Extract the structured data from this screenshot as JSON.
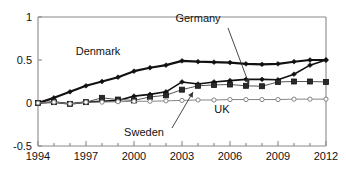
{
  "chart_data": {
    "type": "line",
    "title": "",
    "xlabel": "",
    "ylabel": "",
    "xlim": [
      1994,
      2012
    ],
    "ylim": [
      -0.5,
      1
    ],
    "yticks": [
      "1",
      "0.5",
      "0",
      "-0.5"
    ],
    "ytick_values": [
      1,
      0.5,
      0,
      -0.5
    ],
    "xticks": [
      "1994",
      "1997",
      "2000",
      "2003",
      "2006",
      "2009",
      "2012"
    ],
    "xtick_values": [
      1994,
      1997,
      2000,
      2003,
      2006,
      2009,
      2012
    ],
    "x": [
      1994,
      1995,
      1996,
      1997,
      1998,
      1999,
      2000,
      2001,
      2002,
      2003,
      2004,
      2005,
      2006,
      2007,
      2008,
      2009,
      2010,
      2011,
      2012
    ],
    "grid": false,
    "legend": "inline-annotations",
    "series": [
      {
        "name": "Denmark",
        "marker": "diamond-filled",
        "color": "#111111",
        "linewidth": 2.2,
        "values": [
          0.0,
          0.06,
          0.13,
          0.2,
          0.25,
          0.3,
          0.37,
          0.41,
          0.44,
          0.49,
          0.48,
          0.475,
          0.47,
          0.455,
          0.45,
          0.455,
          0.48,
          0.5,
          0.5
        ]
      },
      {
        "name": "Germany",
        "marker": "diamond-filled",
        "color": "#111111",
        "linewidth": 1.6,
        "values": [
          0.0,
          0.01,
          -0.01,
          0.01,
          0.02,
          0.03,
          0.08,
          0.1,
          0.13,
          0.245,
          0.22,
          0.245,
          0.26,
          0.275,
          0.275,
          0.27,
          0.335,
          0.44,
          0.5
        ]
      },
      {
        "name": "Sweden",
        "marker": "square-filled",
        "color": "#555555",
        "linewidth": 1.0,
        "values": [
          0.0,
          0.01,
          -0.01,
          0.01,
          0.06,
          0.04,
          0.03,
          0.07,
          0.09,
          0.155,
          0.2,
          0.21,
          0.215,
          0.2,
          0.195,
          0.245,
          0.25,
          0.25,
          0.245
        ]
      },
      {
        "name": "UK",
        "marker": "circle-open",
        "color": "#777777",
        "linewidth": 0.9,
        "values": [
          0.0,
          0.01,
          -0.01,
          0.01,
          0.01,
          0.015,
          0.02,
          0.02,
          0.025,
          0.03,
          0.035,
          0.035,
          0.04,
          0.04,
          0.04,
          0.04,
          0.045,
          0.045,
          0.045
        ]
      }
    ],
    "annotations": [
      {
        "text": "Denmark",
        "x_px": 98,
        "y_px": 55,
        "leader": false
      },
      {
        "text": "Germany",
        "x_px": 198,
        "y_px": 22,
        "leader": true,
        "leader_from": [
          228,
          28
        ],
        "leader_to": [
          249,
          84
        ]
      },
      {
        "text": "Sweden",
        "x_px": 144,
        "y_px": 136,
        "leader": true,
        "leader_from": [
          172,
          128
        ],
        "leader_to": [
          193,
          92
        ]
      },
      {
        "text": "UK",
        "x_px": 222,
        "y_px": 113,
        "leader": false
      }
    ]
  },
  "plot_box": {
    "left_px": 38,
    "right_px": 326,
    "top_px": 17,
    "bottom_px": 146
  }
}
